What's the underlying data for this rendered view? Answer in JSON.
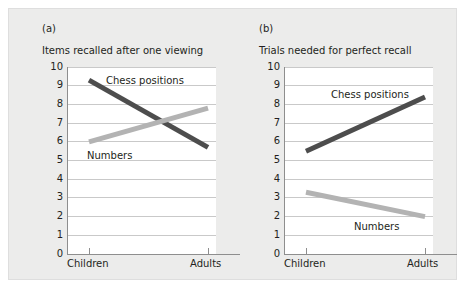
{
  "figure": {
    "background": "#ececeb",
    "plot_background": "#ffffff",
    "dark_series_color": "#4d4d4d",
    "light_series_color": "#b3b3b3",
    "grid_color": "#c9c9c9",
    "axis_color": "#8e8e8e"
  },
  "panels": [
    {
      "tag": "(a)",
      "title": "Items recalled after one viewing",
      "labels": {
        "chess": "Chess positions",
        "numbers": "Numbers"
      }
    },
    {
      "tag": "(b)",
      "title": "Trials needed for perfect recall",
      "labels": {
        "chess": "Chess positions",
        "numbers": "Numbers"
      }
    }
  ],
  "chart_data": [
    {
      "type": "line",
      "title": "Items recalled after one viewing",
      "panel": "(a)",
      "xlabel": "",
      "ylabel": "",
      "categories": [
        "Children",
        "Adults"
      ],
      "x": [
        "Children",
        "Adults"
      ],
      "ylim": [
        0,
        10
      ],
      "yticks": [
        0,
        1,
        2,
        3,
        4,
        5,
        6,
        7,
        8,
        9,
        10
      ],
      "ytick_labels": [
        "0",
        "1",
        "2",
        "3",
        "4",
        "5",
        "6",
        "7",
        "8",
        "9",
        "10"
      ],
      "grid": true,
      "legend": "inline-annotations",
      "series": [
        {
          "name": "Chess positions",
          "values": [
            9.3,
            5.7
          ],
          "color": "#4d4d4d"
        },
        {
          "name": "Numbers",
          "values": [
            6.0,
            7.8
          ],
          "color": "#b3b3b3"
        }
      ]
    },
    {
      "type": "line",
      "title": "Trials needed for perfect recall",
      "panel": "(b)",
      "xlabel": "",
      "ylabel": "",
      "categories": [
        "Children",
        "Adults"
      ],
      "x": [
        "Children",
        "Adults"
      ],
      "ylim": [
        0,
        10
      ],
      "yticks": [
        0,
        1,
        2,
        3,
        4,
        5,
        6,
        7,
        8,
        9,
        10
      ],
      "ytick_labels": [
        "0",
        "1",
        "2",
        "3",
        "4",
        "5",
        "6",
        "7",
        "8",
        "9",
        "10"
      ],
      "grid": true,
      "legend": "inline-annotations",
      "series": [
        {
          "name": "Chess positions",
          "values": [
            5.5,
            8.4
          ],
          "color": "#4d4d4d"
        },
        {
          "name": "Numbers",
          "values": [
            3.3,
            2.0
          ],
          "color": "#b3b3b3"
        }
      ]
    }
  ]
}
